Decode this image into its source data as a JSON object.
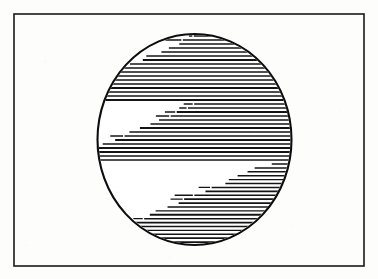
{
  "figure": {
    "canvas": {
      "width": 378,
      "height": 279
    },
    "background_color": "#fdfdfc",
    "ink_color": "#111111"
  },
  "border_frame": {
    "name": "outer frame rectangle",
    "x": 14,
    "y": 14,
    "width": 350,
    "height": 252,
    "stroke_color": "#1a1a1a",
    "stroke_width": 1.6,
    "fill": "none"
  },
  "sphere": {
    "name": "circle outline",
    "shape": "ellipse",
    "center_x": 194.5,
    "center_y": 139.5,
    "radius_x": 97,
    "radius_y": 105.5,
    "stroke_color": "#0d0d0d",
    "stroke_width": 2.1,
    "fill": "#ffffff"
  },
  "hatching": {
    "name": "horizontal shading lines",
    "line_color": "#141414",
    "line_width": 1.6,
    "line_pitch": 4.0,
    "orientation": "horizontal",
    "band_direction": "lower-left to upper-right",
    "bands": [
      {
        "id": "band-top",
        "label": "upper shaded band",
        "y_start": 36,
        "y_end": 100,
        "edge_slope": 2.35,
        "left_at_top": 196,
        "left_at_bottom": 46,
        "clip": "ellipse"
      },
      {
        "id": "band-middle",
        "label": "central shaded band",
        "y_start": 104,
        "y_end": 160,
        "edge_slope": 2.35,
        "left_at_top": 196,
        "left_at_bottom": 64,
        "clip": "ellipse"
      },
      {
        "id": "band-bottom",
        "label": "lower shaded band",
        "y_start": 164,
        "y_end": 246,
        "edge_slope": 2.35,
        "left_at_top": 268,
        "left_at_bottom": 76,
        "clip": "ellipse"
      }
    ]
  }
}
